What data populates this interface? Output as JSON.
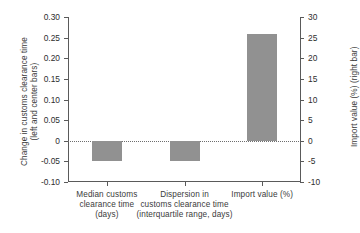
{
  "chart_data": {
    "type": "bar",
    "title": "",
    "categories": [
      "Median customs clearance time (days)",
      "Dispersion in customs clearance time (interquartile range, days)",
      "Import value (%)"
    ],
    "category_lines": [
      [
        "Median customs",
        "clearance time",
        "(days)"
      ],
      [
        "Dispersion in",
        "customs clearance time",
        "(interquartile range, days)"
      ],
      [
        "Import value (%)"
      ]
    ],
    "series": [
      {
        "name": "Change in customs clearance time (left and center bars)",
        "axis": "left",
        "values": [
          -0.05,
          -0.05,
          null
        ]
      },
      {
        "name": "Import value (%) (right bar)",
        "axis": "right",
        "values": [
          null,
          null,
          26
        ]
      }
    ],
    "left_axis": {
      "label_lines": [
        "Change in customs clearance time",
        "(left and center bars)"
      ],
      "ticks": [
        "0.30",
        "0.25",
        "0.20",
        "0.15",
        "0.10",
        "0.05",
        "0",
        "-0.05",
        "-0.10"
      ],
      "tick_values": [
        0.3,
        0.25,
        0.2,
        0.15,
        0.1,
        0.05,
        0,
        -0.05,
        -0.1
      ],
      "ylim": [
        -0.1,
        0.3
      ]
    },
    "right_axis": {
      "label": "Import value (%) (right bar)",
      "ticks": [
        "30",
        "25",
        "20",
        "15",
        "10",
        "5",
        "0",
        "-5",
        "-10"
      ],
      "tick_values": [
        30,
        25,
        20,
        15,
        10,
        5,
        0,
        -5,
        -10
      ],
      "ylim": [
        -10,
        30
      ]
    },
    "xlabel": "",
    "grid": false,
    "legend": "none",
    "zero_reference_line": true,
    "colors": {
      "bar": "#919191",
      "axis": "#5a5a5a",
      "text": "#3b3b3b",
      "zero_line": "#6e6e6e",
      "background": "#ffffff"
    }
  }
}
